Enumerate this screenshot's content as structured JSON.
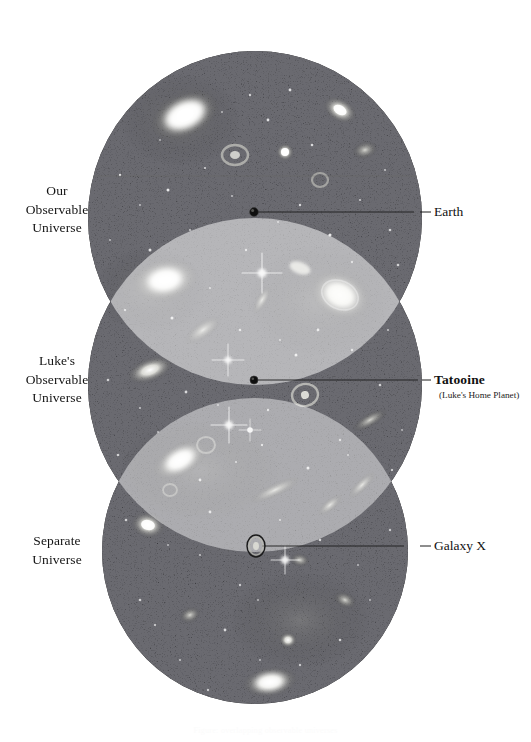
{
  "figure": {
    "background_color": "#ffffff",
    "circle_fill": "#0d0d0d",
    "overlap_highlight": "#ffffff",
    "leader_line_color": "#1a1a1a"
  },
  "left_labels": [
    {
      "name": "our-observable-universe",
      "lines": [
        "Our",
        "Observable",
        "Universe"
      ]
    },
    {
      "name": "lukes-observable-universe",
      "lines": [
        "Luke's",
        "Observable",
        "Universe"
      ]
    },
    {
      "name": "separate-universe",
      "lines": [
        "Separate",
        "Universe"
      ]
    }
  ],
  "callouts": [
    {
      "name": "earth",
      "title": "Earth",
      "sub": ""
    },
    {
      "name": "tatooine",
      "title": "Tatooine",
      "sub": "(Luke's Home Planet)"
    },
    {
      "name": "galaxy-x",
      "title": "Galaxy X",
      "sub": ""
    }
  ],
  "markers": [
    {
      "name": "earth-marker",
      "label": "Earth",
      "x": 254,
      "y": 212
    },
    {
      "name": "tatooine-marker",
      "label": "Tatooine",
      "x": 254,
      "y": 380
    },
    {
      "name": "galaxy-x-marker",
      "label": "Galaxy X",
      "x": 256,
      "y": 546
    }
  ],
  "spheres": [
    {
      "name": "our-observable-universe-sphere",
      "cx": 255,
      "cy": 218,
      "r": 167
    },
    {
      "name": "lukes-observable-universe-sphere",
      "cx": 255,
      "cy": 385,
      "r": 167
    },
    {
      "name": "separate-universe-sphere",
      "cx": 255,
      "cy": 551,
      "r": 153
    }
  ],
  "bottom_caption": "Figure: overlapping observable universes"
}
